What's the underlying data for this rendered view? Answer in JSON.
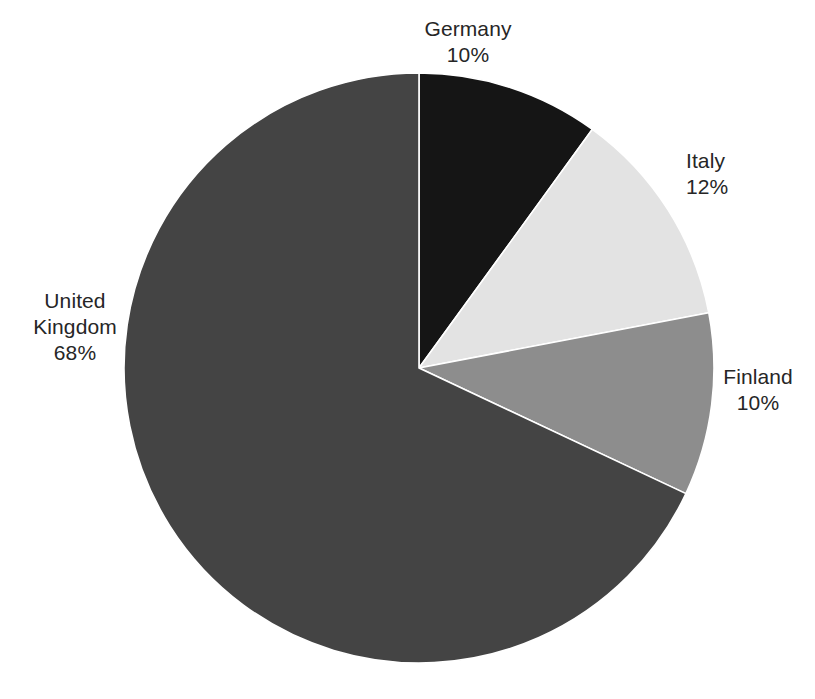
{
  "chart_data": {
    "type": "pie",
    "title": "",
    "subtitle": "",
    "xlabel": "",
    "ylabel": "",
    "legend_position": "none",
    "grid": false,
    "start_angle_deg": 0,
    "direction": "clockwise",
    "value_unit": "%",
    "categories": [
      "Germany",
      "Italy",
      "Finland",
      "United Kingdom"
    ],
    "values": [
      10,
      12,
      10,
      68
    ],
    "slices": [
      {
        "name": "Germany",
        "value": 10,
        "value_label": "10%",
        "color": "#151515",
        "start_deg": 0,
        "end_deg": 36
      },
      {
        "name": "Italy",
        "value": 12,
        "value_label": "12%",
        "color": "#e3e3e3",
        "start_deg": 36,
        "end_deg": 79.2
      },
      {
        "name": "Finland",
        "value": 10,
        "value_label": "10%",
        "color": "#8d8d8d",
        "start_deg": 79.2,
        "end_deg": 115.2
      },
      {
        "name": "United Kingdom",
        "value": 68,
        "value_label": "68%",
        "color": "#444444",
        "start_deg": 115.2,
        "end_deg": 360
      }
    ]
  },
  "labels": {
    "germany": {
      "name": "Germany",
      "value": "10%"
    },
    "italy": {
      "name": "Italy",
      "value": "12%"
    },
    "finland": {
      "name": "Finland",
      "value": "10%"
    },
    "uk": {
      "name_line1": "United",
      "name_line2": "Kingdom",
      "value": "68%"
    }
  },
  "style": {
    "background": "#ffffff",
    "text_color": "#262626",
    "slice_outline": "#ffffff",
    "outline_width": 1.6
  }
}
